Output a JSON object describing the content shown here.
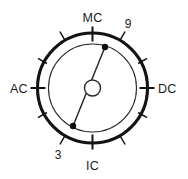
{
  "figure": {
    "type": "dial-diagram",
    "width": 188,
    "height": 179
  },
  "colors": {
    "stroke_outer": "#131313",
    "stroke_inner": "#2b2b2b",
    "background": "#ffffff",
    "text": "#1a1a1a",
    "dot": "#0d0d0d"
  },
  "dial": {
    "center": {
      "x": 92.5,
      "y": 88
    },
    "outer_radius": 55,
    "inner_radius": 44,
    "hub_radius": 8,
    "labels": [
      {
        "id": "mc",
        "text": "MC",
        "angle_deg": 90,
        "position": "top",
        "x": 92.5,
        "y": 18
      },
      {
        "id": "ac",
        "text": "AC",
        "angle_deg": 180,
        "position": "left",
        "x": 19,
        "y": 92
      },
      {
        "id": "dc",
        "text": "DC",
        "angle_deg": 0,
        "position": "right",
        "x": 167,
        "y": 92
      },
      {
        "id": "ic",
        "text": "IC",
        "angle_deg": 270,
        "position": "bottom",
        "x": 92.5,
        "y": 170
      },
      {
        "id": "nine",
        "text": "9",
        "angle_deg": 60,
        "position": "upper-right",
        "x": 125,
        "y": 30
      },
      {
        "id": "three",
        "text": "3",
        "angle_deg": 240,
        "position": "lower-left",
        "x": 60,
        "y": 158
      }
    ],
    "major_ticks_deg": [
      0,
      90,
      180,
      270
    ],
    "minor_ticks_deg": [
      30,
      60,
      120,
      150,
      210,
      240,
      300,
      330
    ],
    "needle": {
      "end_a": {
        "x": 105,
        "y": 47,
        "label_ref": "9"
      },
      "end_b": {
        "x": 73,
        "y": 126,
        "label_ref": "3"
      },
      "dot_radius": 3.2
    }
  }
}
